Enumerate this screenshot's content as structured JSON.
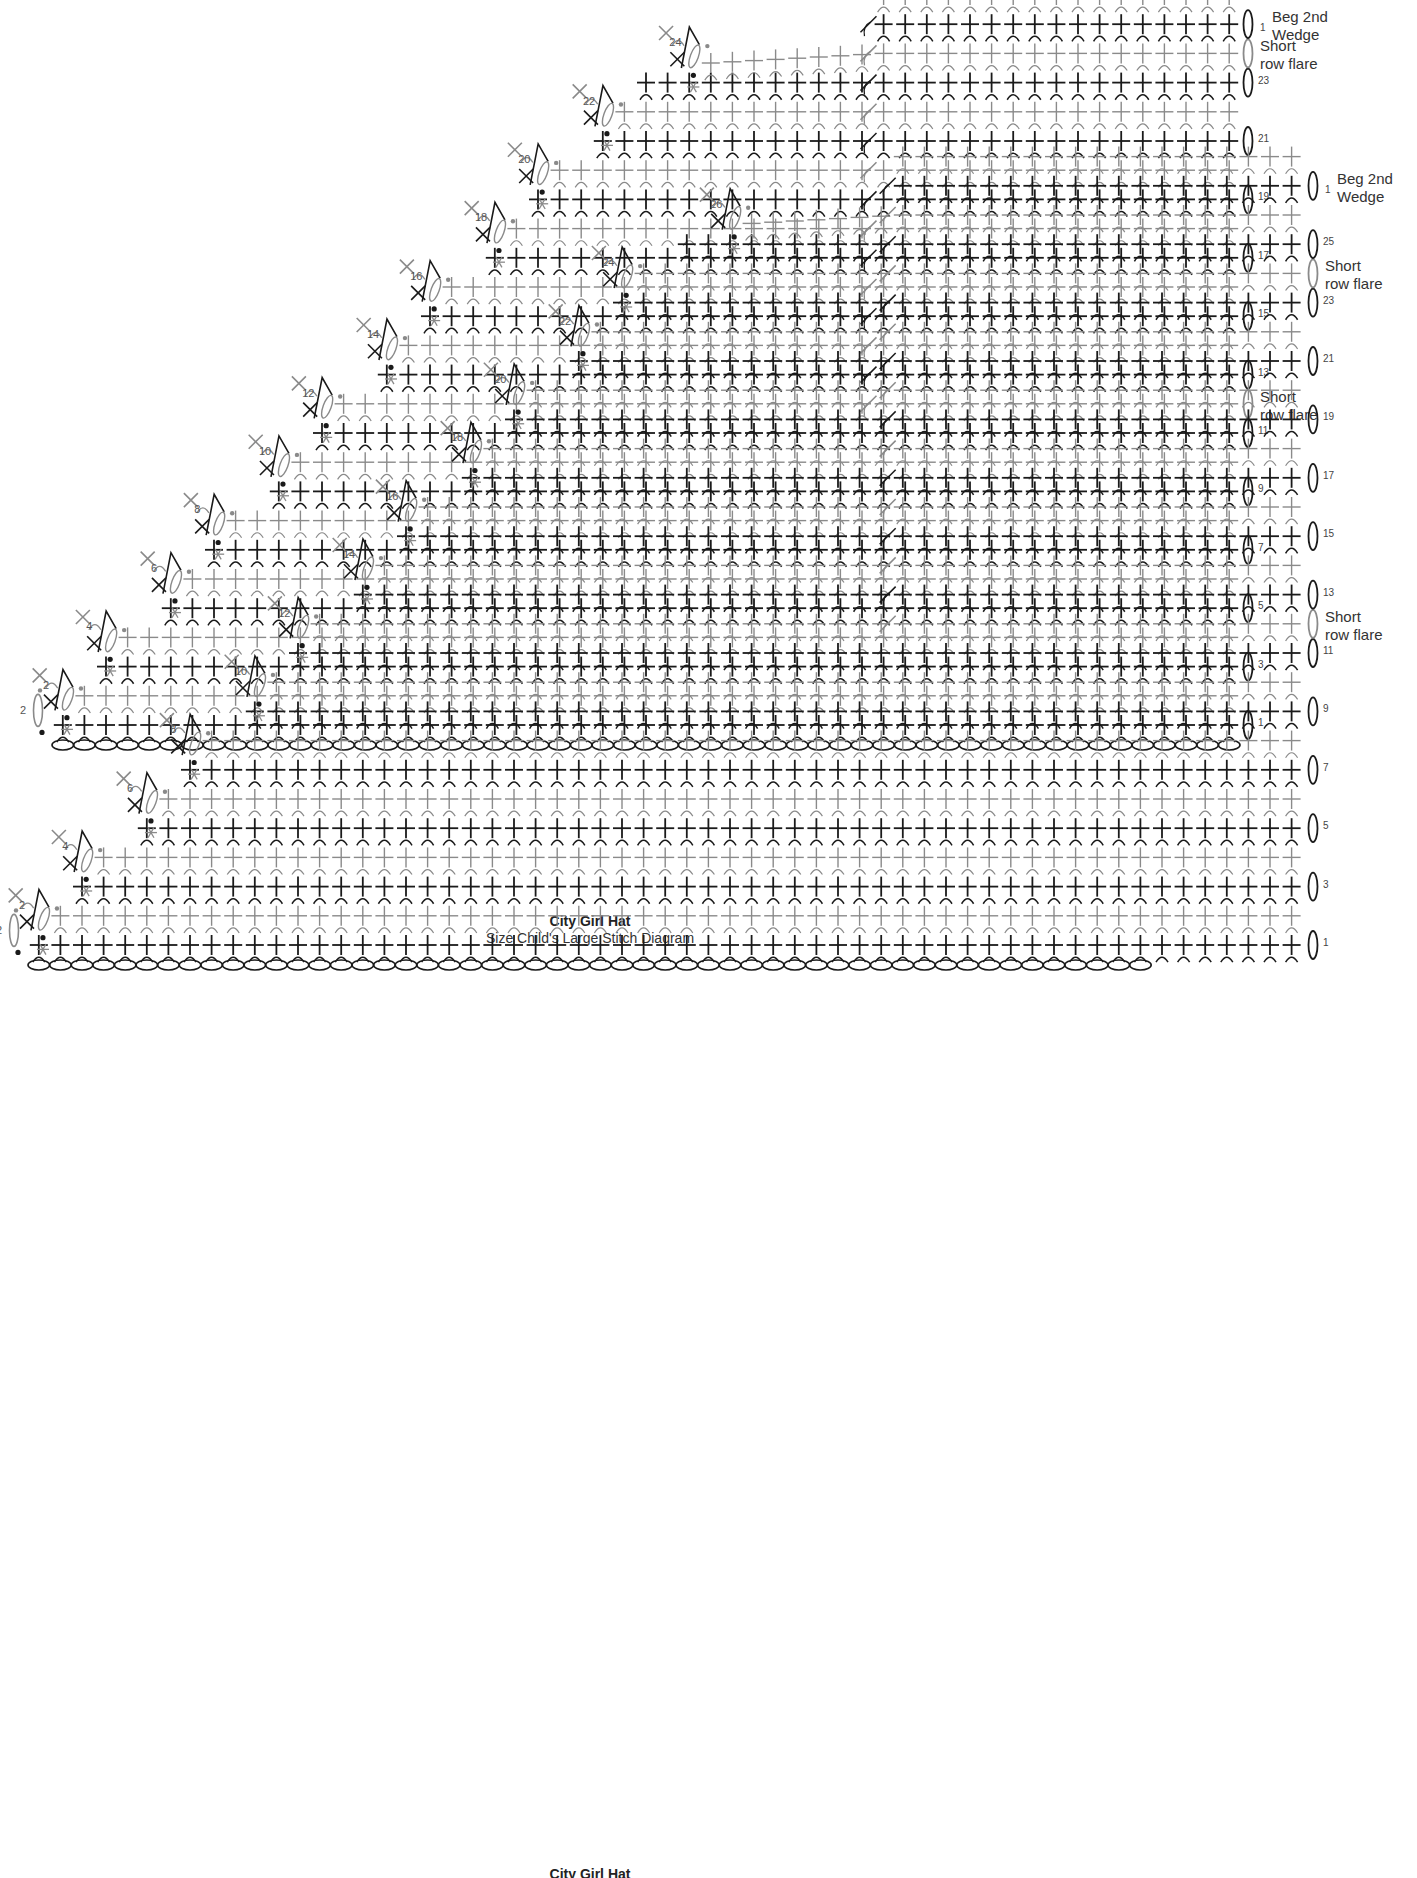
{
  "colors": {
    "dark": "#1a1a1a",
    "light": "#8a8a8a",
    "label": "#555555",
    "background": "#ffffff"
  },
  "stitch_legend": {
    "cross": "single crochet (sc)",
    "arc": "back loop indicator",
    "oval": "chain (ch)",
    "tall_t": "double crochet / turning stitch",
    "asterisk": "marker",
    "dot": "slip stitch (sl st)"
  },
  "diagrams": [
    {
      "id": "top",
      "top": 0,
      "foundation_chains": 55,
      "origin_x": 52,
      "row1_y": 725,
      "col_w": 21.6,
      "row_h": 29.2,
      "right_x": 1240,
      "stair_step_numbers": [
        "2",
        "2",
        "4",
        "6",
        "8",
        "10",
        "12",
        "14",
        "16",
        "18",
        "20",
        "22",
        "24"
      ],
      "right_labels": [
        {
          "row": 1,
          "text": "1"
        },
        {
          "row": 3,
          "text": "3"
        },
        {
          "row": 5,
          "text": "5"
        },
        {
          "row": 7,
          "text": "7"
        },
        {
          "row": 9,
          "text": "9"
        },
        {
          "row": 11,
          "text": "11"
        },
        {
          "row": 12,
          "text": "Short row flare",
          "multiline": [
            "Short",
            "row flare"
          ],
          "gray": true
        },
        {
          "row": 13,
          "text": "13"
        },
        {
          "row": 15,
          "text": "15"
        },
        {
          "row": 17,
          "text": "17"
        },
        {
          "row": 19,
          "text": "19"
        },
        {
          "row": 21,
          "text": "21"
        },
        {
          "row": 23,
          "text": "23"
        },
        {
          "row": 24,
          "text": "Short row flare",
          "multiline": [
            "Short",
            "row flare"
          ],
          "gray": true
        },
        {
          "row": 25,
          "text": "1 Beg 2nd Wedge",
          "num": "1",
          "multiline": [
            "Beg 2nd",
            "Wedge"
          ]
        }
      ],
      "rows_total": 26,
      "stair_start_col_per_row": 2,
      "plateau_row": 23,
      "plateau_end_col": 38,
      "short_row_col": 38,
      "caption": {
        "title": "City Girl Hat",
        "subtitle": "Size Child's Large Stitch Diagram"
      }
    },
    {
      "id": "bottom",
      "top": 910,
      "foundation_chains": 52,
      "origin_x": 28,
      "row1_y": 945,
      "col_w": 21.6,
      "row_h": 29.2,
      "right_x": 1305,
      "stair_step_numbers": [
        "2",
        "2",
        "4",
        "6",
        "8",
        "10",
        "12",
        "14",
        "16",
        "18",
        "20",
        "22",
        "24",
        "26"
      ],
      "right_labels": [
        {
          "row": 1,
          "text": "1"
        },
        {
          "row": 3,
          "text": "3"
        },
        {
          "row": 5,
          "text": "5"
        },
        {
          "row": 7,
          "text": "7"
        },
        {
          "row": 9,
          "text": "9"
        },
        {
          "row": 11,
          "text": "11"
        },
        {
          "row": 12,
          "text": "Short row flare",
          "multiline": [
            "Short",
            "row flare"
          ],
          "gray": true
        },
        {
          "row": 13,
          "text": "13"
        },
        {
          "row": 15,
          "text": "15"
        },
        {
          "row": 17,
          "text": "17"
        },
        {
          "row": 19,
          "text": "19"
        },
        {
          "row": 21,
          "text": "21"
        },
        {
          "row": 23,
          "text": "23"
        },
        {
          "row": 24,
          "text": "Short row flare",
          "multiline": [
            "Short",
            "row flare"
          ],
          "gray": true
        },
        {
          "row": 25,
          "text": "25"
        },
        {
          "row": 27,
          "text": "1 Beg 2nd Wedge",
          "num": "1",
          "multiline": [
            "Beg 2nd",
            "Wedge"
          ]
        }
      ],
      "rows_total": 28,
      "stair_start_col_per_row": 2,
      "plateau_row": 25,
      "plateau_end_col": 40,
      "short_row_col": 40,
      "caption": {
        "title": "City Girl Hat",
        "subtitle": ""
      }
    }
  ]
}
